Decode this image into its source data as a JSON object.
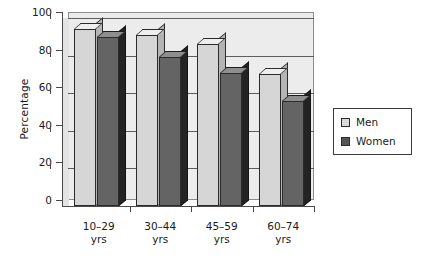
{
  "chart_data": {
    "type": "bar",
    "title": "",
    "xlabel": "",
    "ylabel": "Percentage",
    "ylim": [
      0,
      100
    ],
    "yticks": [
      0,
      20,
      40,
      60,
      80,
      100
    ],
    "ytick_labels": [
      "0",
      "20",
      "40",
      "60",
      "80",
      "100"
    ],
    "grid": true,
    "legend_position": "right",
    "style": "3d-bar",
    "categories": [
      "10–29\nyrs",
      "30–44\nyrs",
      "45–59\nyrs",
      "60–74\nyrs"
    ],
    "category_labels": [
      {
        "line1": "10–29",
        "line2": "yrs"
      },
      {
        "line1": "30–44",
        "line2": "yrs"
      },
      {
        "line1": "45–59",
        "line2": "yrs"
      },
      {
        "line1": "60–74",
        "line2": "yrs"
      }
    ],
    "series": [
      {
        "name": "Men",
        "color": "#d9d9d9",
        "values": [
          94,
          91,
          86,
          70
        ]
      },
      {
        "name": "Women",
        "color": "#555555",
        "values": [
          90,
          79,
          71,
          56
        ]
      }
    ]
  },
  "legend": {
    "entries": [
      {
        "label": "Men",
        "swatch": "men"
      },
      {
        "label": "Women",
        "swatch": "women"
      }
    ]
  },
  "axes": {
    "y_label": "Percentage"
  }
}
